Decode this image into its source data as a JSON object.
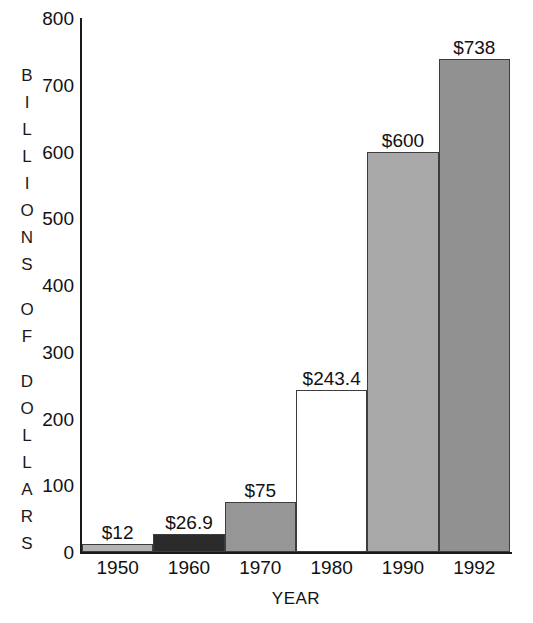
{
  "chart_data": {
    "type": "bar",
    "title": "",
    "xlabel": "YEAR",
    "ylabel": "BILLIONS OF DOLLARS",
    "categories": [
      "1950",
      "1960",
      "1970",
      "1980",
      "1990",
      "1992"
    ],
    "values": [
      12,
      26.9,
      75,
      243.4,
      600,
      738
    ],
    "data_labels": [
      "$12",
      "$26.9",
      "$75",
      "$243.4",
      "$600",
      "$738"
    ],
    "bar_colors": [
      "#b3b3b3",
      "#2b2b2b",
      "#969696",
      "#ffffff",
      "#a8a8a8",
      "#919191"
    ],
    "bar_border_color": "#3d3d3d",
    "ylim": [
      0,
      800
    ],
    "ytick_values": [
      0,
      100,
      200,
      300,
      400,
      500,
      600,
      700,
      800
    ],
    "ytick_labels": [
      "0",
      "100",
      "200",
      "300",
      "400",
      "500",
      "600",
      "700",
      "800"
    ],
    "grid": false,
    "legend": "none",
    "axis_color": "#1a1a1a",
    "background": "#ffffff"
  },
  "y_axis_title_words": [
    [
      "B",
      "I",
      "L",
      "L",
      "I",
      "O",
      "N",
      "S"
    ],
    [
      "O",
      "F"
    ],
    [
      "D",
      "O",
      "L",
      "L",
      "A",
      "R",
      "S"
    ]
  ]
}
